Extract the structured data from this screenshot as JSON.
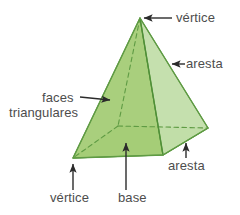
{
  "figure": {
    "shape": "square-pyramid",
    "colors": {
      "face_left": "#a6cd78",
      "face_front": "#9ccd74",
      "face_right": "#c3dfab",
      "base": "#8fc268",
      "outline": "#5f9b44",
      "hidden_edge": "#5f9b44",
      "arrow": "#2b2b2b",
      "text": "#4d4d4d",
      "background": "#ffffff"
    },
    "geometry": {
      "apex": [
        140,
        18
      ],
      "base_front": [
        163,
        155
      ],
      "base_left": [
        73,
        158
      ],
      "base_right": [
        208,
        128
      ],
      "base_back_hidden": [
        118,
        126
      ]
    }
  },
  "labels": {
    "vertice_top": "vértice",
    "aresta_right": "aresta",
    "faces": "faces",
    "triangulares": "triangulares",
    "aresta_bottom": "aresta",
    "vertice_bottom": "vértice",
    "base": "base"
  }
}
